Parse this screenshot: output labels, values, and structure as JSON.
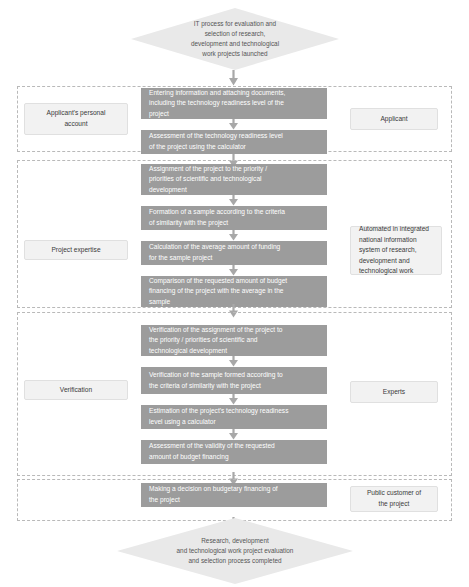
{
  "diagram": {
    "title_start": "IT process for evaluation and\nselection of research,\ndevelopment and technological\nwork projects launched",
    "title_end": "Research, development\nand technological work project evaluation\nand selection process completed",
    "colors": {
      "process_fill": "#9c9c9c",
      "role_fill": "#f2f2f2",
      "terminator_fill": "#e9e9e9",
      "lane_border": "#b9b9b9",
      "process_text": "#ffffff",
      "role_text": "#3a3a3a"
    },
    "lanes": [
      {
        "id": "lane-1",
        "stage_label": "Applicant's personal\naccount",
        "actor_label": "Applicant",
        "steps": [
          "Entering information and attaching documents,\nincluding the technology readiness level of the\nproject",
          "Assessment of the technology readiness level\nof the project using the calculator"
        ]
      },
      {
        "id": "lane-2",
        "stage_label": "Project expertise",
        "actor_label": "Automated in integrated\nnational information\nsystem of research,\ndevelopment and\ntechnological work",
        "steps": [
          "Assignment of the project to the priority /\npriorities of scientific and technological\ndevelopment",
          "Formation of a sample according to the criteria\nof similarity with the project",
          "Calculation of the average amount of funding\nfor the sample project",
          "Comparison of the requested amount of budget\nfinancing of the project with the average in the\nsample"
        ]
      },
      {
        "id": "lane-3",
        "stage_label": "Verification",
        "actor_label": "Experts",
        "steps": [
          "Verification of the assignment of the project to\nthe priority / priorities of scientific and\ntechnological development",
          "Verification of the sample formed according to\nthe criteria of similarity with the project",
          "Estimation of the project's technology readiness\nlevel using a calculator",
          "Assessment of the validity of the requested\namount of budget financing"
        ]
      },
      {
        "id": "lane-4",
        "stage_label": "",
        "actor_label": "Public customer of\nthe project",
        "steps": [
          "Making a decision on budgetary financing of\nthe project"
        ]
      }
    ]
  }
}
